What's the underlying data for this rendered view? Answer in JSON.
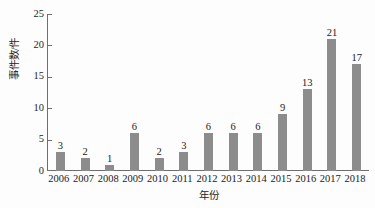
{
  "chart_data": {
    "type": "bar",
    "title": "",
    "subtitle": "",
    "xlabel": "年份",
    "ylabel": "事件数/件",
    "categories": [
      "2006",
      "2007",
      "2008",
      "2009",
      "2010",
      "2011",
      "2012",
      "2013",
      "2014",
      "2015",
      "2016",
      "2017",
      "2018"
    ],
    "values": [
      3,
      2,
      1,
      6,
      2,
      3,
      6,
      6,
      6,
      9,
      13,
      21,
      17
    ],
    "data_labels": [
      "3",
      "2",
      "1",
      "6",
      "2",
      "3",
      "6",
      "6",
      "6",
      "9",
      "13",
      "21",
      "17"
    ],
    "ylim": [
      0,
      25
    ],
    "xlim_categories": 13,
    "y_ticks": [
      0,
      5,
      10,
      15,
      20,
      25
    ],
    "y_tick_labels": [
      "0",
      "5",
      "10",
      "15",
      "20",
      "25"
    ],
    "grid": false,
    "legend": null,
    "legend_position": "none",
    "bar_color": "#8c8c8c",
    "axis_color": "#6e6e6e",
    "text_color": "#1a1a1a",
    "background_color": "#fdfdfd",
    "show_value_labels": true,
    "tick_direction": "in"
  }
}
